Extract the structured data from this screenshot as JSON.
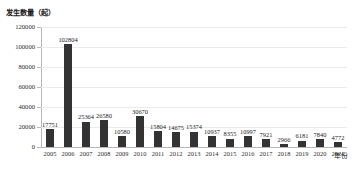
{
  "chart_data": {
    "type": "bar",
    "title": "",
    "ylabel": "发生数量（起）",
    "xlabel": "年份",
    "ylim": [
      0,
      120000
    ],
    "yticks": [
      0,
      20000,
      40000,
      60000,
      80000,
      100000,
      120000
    ],
    "ytick_labels": [
      "0",
      "20000",
      "40000",
      "60000",
      "80000",
      "100000",
      "120000"
    ],
    "grid": true,
    "legend": null,
    "bar_color": "#333333",
    "categories": [
      "2005",
      "2006",
      "2007",
      "2008",
      "2009",
      "2010",
      "2011",
      "2012",
      "2013",
      "2014",
      "2015",
      "2016",
      "2017",
      "2018",
      "2019",
      "2020",
      "2021"
    ],
    "values": [
      17751,
      102804,
      25364,
      26580,
      10580,
      30670,
      15804,
      14675,
      15374,
      10937,
      8355,
      10997,
      7921,
      2966,
      6181,
      7840,
      4772
    ],
    "data_labels": [
      "17751",
      "102804",
      "25364",
      "26580",
      "10580",
      "30670",
      "15804",
      "14675",
      "15374",
      "10937",
      "8355",
      "10997",
      "7921",
      "2966",
      "6181",
      "7840",
      "4772"
    ]
  }
}
